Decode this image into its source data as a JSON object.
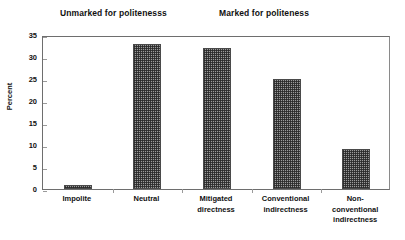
{
  "chart_data": {
    "type": "bar",
    "title": "",
    "xlabel": "",
    "ylabel": "Percent",
    "ylim": [
      0,
      35
    ],
    "yticks": [
      0,
      5,
      10,
      15,
      20,
      25,
      30,
      35
    ],
    "grid": false,
    "legend": "none",
    "categories": [
      "Impolite",
      "Neutral",
      "Mitigated directness",
      "Conventional indirectness",
      "Non-conventional indirectness"
    ],
    "category_lines": [
      [
        "Impolite"
      ],
      [
        "Neutral"
      ],
      [
        "Mitigated",
        "directness"
      ],
      [
        "Conventional",
        "indirectness"
      ],
      [
        "Non-",
        "conventional",
        "indirectness"
      ]
    ],
    "values": [
      1,
      33,
      32,
      25,
      9
    ],
    "annotations": [
      {
        "text": "Unmarked for politenesss",
        "covers": [
          "Impolite",
          "Neutral"
        ]
      },
      {
        "text": "Marked for politeness",
        "covers": [
          "Mitigated directness",
          "Conventional indirectness",
          "Non-conventional indirectness"
        ]
      }
    ],
    "colors": {
      "bar_fill": "#9b9b9b",
      "bar_pattern": "#282828",
      "bar_border": "#4a4a4a",
      "axis": "#6e6e6e",
      "text": "#111111",
      "background": "#ffffff"
    }
  },
  "groups": {
    "unmarked_label": "Unmarked for politenesss",
    "marked_label": "Marked for politeness"
  },
  "axis": {
    "y_title": "Percent"
  }
}
